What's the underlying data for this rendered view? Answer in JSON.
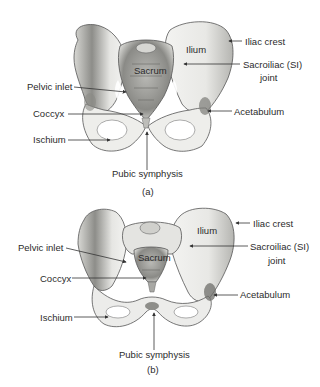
{
  "figure": {
    "panels": [
      {
        "id": "a",
        "caption": "(a)",
        "labels": {
          "iliac_crest": "Iliac crest",
          "ilium": "Ilium",
          "sacroiliac_line1": "Sacroiliac (SI)",
          "sacroiliac_line2": "joint",
          "sacrum": "Sacrum",
          "pelvic_inlet": "Pelvic inlet",
          "coccyx": "Coccyx",
          "acetabulum": "Acetabulum",
          "ischium": "Ischium",
          "pubic_symphysis": "Pubic symphysis"
        }
      },
      {
        "id": "b",
        "caption": "(b)",
        "labels": {
          "iliac_crest": "Iliac crest",
          "ilium": "Ilium",
          "sacroiliac_line1": "Sacroiliac (SI)",
          "sacroiliac_line2": "joint",
          "sacrum": "Sacrum",
          "pelvic_inlet": "Pelvic inlet",
          "coccyx": "Coccyx",
          "acetabulum": "Acetabulum",
          "ischium": "Ischium",
          "pubic_symphysis": "Pubic symphysis"
        }
      }
    ],
    "colors": {
      "bone_fill": "#ebebe8",
      "bone_shade": "#9a9a96",
      "bone_outline": "#555555",
      "label_text": "#2b2b2b",
      "leader_line": "#333333"
    }
  }
}
